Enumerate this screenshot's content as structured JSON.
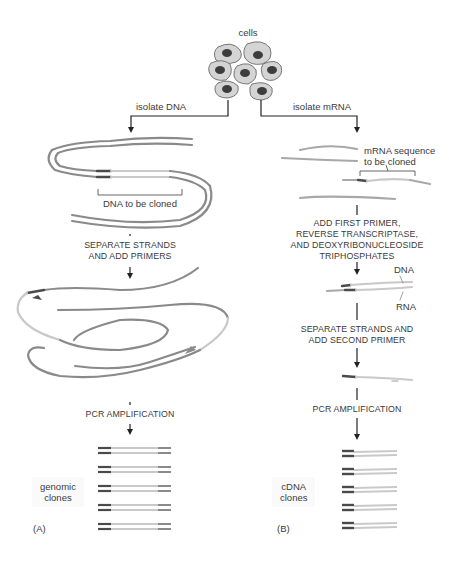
{
  "figure": {
    "top_label": "cells",
    "colors": {
      "strand": "#8a8a8a",
      "highlight": "#c9c9c9",
      "primer": "#4a4a4a",
      "cell_fill": "#d4d4d4",
      "nucleus": "#3d3d3d",
      "arrow": "#222222"
    }
  },
  "panel_a": {
    "panel_label": "(A)",
    "branch_label": "isolate DNA",
    "bracket_label": "DNA to be cloned",
    "steps": [
      {
        "text": "SEPARATE STRANDS\nAND ADD PRIMERS"
      },
      {
        "text": "PCR AMPLIFICATION"
      }
    ],
    "result_label": "genomic\nclones",
    "clone_count": 5
  },
  "panel_b": {
    "panel_label": "(B)",
    "branch_label": "isolate mRNA",
    "bracket_label": "mRNA sequence\nto be cloned",
    "steps": [
      {
        "text": "ADD FIRST PRIMER,\nREVERSE TRANSCRIPTASE,\nAND DEOXYRIBONUCLEOSIDE\nTRIPHOSPHATES"
      },
      {
        "text": "SEPARATE STRANDS AND\nADD SECOND PRIMER"
      },
      {
        "text": "PCR AMPLIFICATION"
      }
    ],
    "strand_labels": {
      "dna": "DNA",
      "rna": "RNA"
    },
    "result_label": "cDNA\nclones",
    "clone_count": 5
  }
}
